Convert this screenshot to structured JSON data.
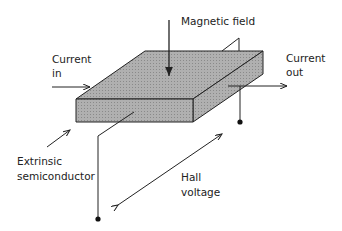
{
  "diagram": {
    "labels": {
      "magnetic_field": "Magnetic field",
      "current_in_1": "Current",
      "current_in_2": "in",
      "current_out_1": "Current",
      "current_out_2": "out",
      "extrinsic_1": "Extrinsic",
      "extrinsic_2": "semiconductor",
      "hall_1": "Hall",
      "hall_2": "voltage"
    },
    "colors": {
      "slab_fill": "#a8a8a8",
      "line": "#222222"
    }
  }
}
